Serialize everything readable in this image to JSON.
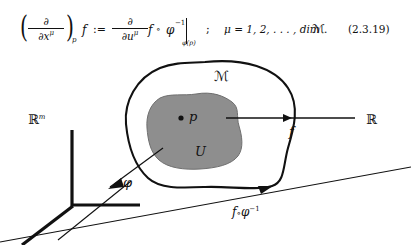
{
  "equation": {
    "lhs_paren_open": "(",
    "lhs_paren_close": ")",
    "lhs_frac_num": "∂",
    "lhs_frac_den": "∂x",
    "lhs_frac_den_sup": "μ",
    "lhs_paren_sub": "p",
    "lhs_function": "f",
    "defined_as": ":=",
    "rhs_frac_num": "∂",
    "rhs_frac_den": "∂u",
    "rhs_frac_den_sup": "μ",
    "rhs_function": "f",
    "compose": "∘",
    "phi": "φ",
    "phi_exponent": "−1",
    "eval_bar_subscript_open": "φ(",
    "eval_bar_subscript_p": "p",
    "eval_bar_subscript_close": ")",
    "separator": ";",
    "index_range": "μ = 1, 2, . . . , dim",
    "manifold_symbol": "ℳ",
    "period": ".",
    "equation_number": "(2.3.19)"
  },
  "diagram": {
    "manifold_label": "ℳ",
    "open_set_label": "U",
    "point_label": "p",
    "domain_label": "ℝ",
    "domain_label_exponent": "m",
    "codomain_label": "ℝ",
    "map_f_label": "f",
    "chart_phi_label": "φ",
    "composite_label_f": "f",
    "composite_label_compose": "∘",
    "composite_label_phi": "φ",
    "composite_label_exponent": "−1",
    "colors": {
      "ink": "#111111",
      "open_set_fill": "#8e8e8e",
      "open_set_stroke": "#6f6f6f",
      "background": "#ffffff"
    }
  }
}
